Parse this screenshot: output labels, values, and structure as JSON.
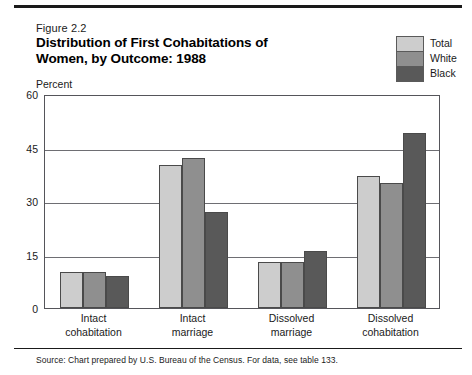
{
  "figure": {
    "number": "Figure 2.2",
    "title_line1": "Distribution of First Cohabitations of",
    "title_line2": "Women, by Outcome: 1988",
    "axis_note": "Percent",
    "source": "Source: Chart prepared by U.S. Bureau of the Census. For data, see table 133."
  },
  "legend": {
    "items": [
      {
        "label": "Total",
        "color": "#cdcdcd"
      },
      {
        "label": "White",
        "color": "#8f8f8f"
      },
      {
        "label": "Black",
        "color": "#595959"
      }
    ]
  },
  "axis": {
    "y_ticks": [
      "0",
      "15",
      "30",
      "45",
      "60"
    ]
  },
  "chart_data": {
    "type": "bar",
    "title": "Distribution of First Cohabitations of Women, by Outcome: 1988",
    "subtitle": "Figure 2.2",
    "xlabel": "",
    "ylabel": "Percent",
    "ylim": [
      0,
      60
    ],
    "yticks": [
      0,
      15,
      30,
      45,
      60
    ],
    "grid": true,
    "legend_position": "top-right",
    "categories": [
      "Intact cohabitation",
      "Intact marriage",
      "Dissolved marriage",
      "Dissolved cohabitation"
    ],
    "category_lines": [
      [
        "Intact",
        "cohabitation"
      ],
      [
        "Intact",
        "marriage"
      ],
      [
        "Dissolved",
        "marriage"
      ],
      [
        "Dissolved",
        "cohabitation"
      ]
    ],
    "series": [
      {
        "name": "Total",
        "color": "#cdcdcd",
        "values": [
          10,
          40,
          13,
          37
        ]
      },
      {
        "name": "White",
        "color": "#8f8f8f",
        "values": [
          10,
          42,
          13,
          35
        ]
      },
      {
        "name": "Black",
        "color": "#595959",
        "values": [
          9,
          27,
          16,
          49
        ]
      }
    ],
    "annotation": "Source: Chart prepared by U.S. Bureau of the Census. For data, see table 133."
  }
}
